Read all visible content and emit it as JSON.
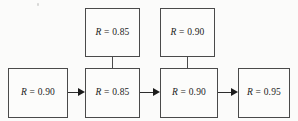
{
  "diagram": {
    "type": "reliability-block-diagram",
    "background_color": "#fbfbfa",
    "line_color": "#4a4a4a",
    "text_color": "#1c1c1c",
    "symbol": "R",
    "equals": "=",
    "blocks": [
      {
        "id": "stage-1",
        "row": "bottom",
        "position": 1,
        "symbol": "R",
        "equals": "=",
        "value": "0.90",
        "label": "R = 0.90"
      },
      {
        "id": "stage-2-main",
        "row": "bottom",
        "position": 2,
        "symbol": "R",
        "equals": "=",
        "value": "0.85",
        "label": "R = 0.85"
      },
      {
        "id": "stage-3-main",
        "row": "bottom",
        "position": 3,
        "symbol": "R",
        "equals": "=",
        "value": "0.90",
        "label": "R = 0.90"
      },
      {
        "id": "stage-4",
        "row": "bottom",
        "position": 4,
        "symbol": "R",
        "equals": "=",
        "value": "0.95",
        "label": "R = 0.95"
      },
      {
        "id": "stage-2-redundant",
        "row": "top",
        "position": 2,
        "symbol": "R",
        "equals": "=",
        "value": "0.85",
        "label": "R = 0.85"
      },
      {
        "id": "stage-3-redundant",
        "row": "top",
        "position": 3,
        "symbol": "R",
        "equals": "=",
        "value": "0.90",
        "label": "R = 0.90"
      }
    ],
    "connections": [
      {
        "id": "arrow-1-2",
        "kind": "arrow",
        "from": "stage-1",
        "to": "stage-2-main"
      },
      {
        "id": "arrow-2-3",
        "kind": "arrow",
        "from": "stage-2-main",
        "to": "stage-3-main"
      },
      {
        "id": "arrow-3-4",
        "kind": "arrow",
        "from": "stage-3-main",
        "to": "stage-4"
      },
      {
        "id": "link-parallel-2",
        "kind": "line",
        "from": "stage-2-redundant",
        "to": "stage-2-main"
      },
      {
        "id": "link-parallel-3",
        "kind": "line",
        "from": "stage-3-redundant",
        "to": "stage-3-main"
      }
    ]
  }
}
